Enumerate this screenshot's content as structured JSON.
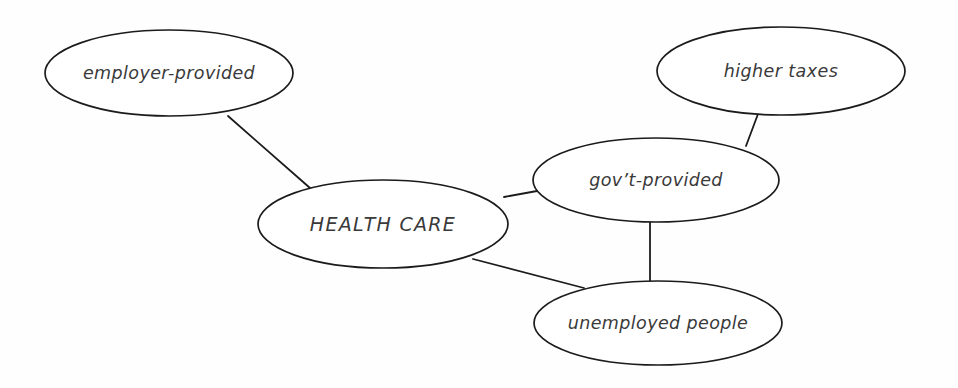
{
  "diagram": {
    "type": "concept-map",
    "title_node": "HEALTH CARE",
    "background_color": "#fefefe",
    "stroke_color": "#1b1b1b",
    "text_color": "#3a3a3a",
    "nodes": [
      {
        "id": "employer-provided",
        "label": "employer-provided",
        "cx": 169,
        "cy": 73,
        "rx": 124,
        "ry": 43,
        "style": "lowercase"
      },
      {
        "id": "higher-taxes",
        "label": "higher taxes",
        "cx": 781,
        "cy": 71,
        "rx": 124,
        "ry": 44,
        "style": "lowercase"
      },
      {
        "id": "govt-provided",
        "label": "gov’t-provided",
        "cx": 656,
        "cy": 180,
        "rx": 123,
        "ry": 42,
        "style": "lowercase"
      },
      {
        "id": "health-care",
        "label": "HEALTH CARE",
        "cx": 383,
        "cy": 224,
        "rx": 125,
        "ry": 44,
        "style": "uppercase"
      },
      {
        "id": "unemployed-people",
        "label": "unemployed people",
        "cx": 658,
        "cy": 323,
        "rx": 124,
        "ry": 42,
        "style": "lowercase"
      }
    ],
    "edges": [
      {
        "id": "edge-employer-to-health",
        "from": "employer-provided",
        "to": "health-care",
        "x1": 228,
        "y1": 116,
        "x2": 310,
        "y2": 188
      },
      {
        "id": "edge-health-to-govt",
        "from": "health-care",
        "to": "govt-provided",
        "x1": 504,
        "y1": 197,
        "x2": 537,
        "y2": 191
      },
      {
        "id": "edge-health-to-unemployed",
        "from": "health-care",
        "to": "unemployed-people",
        "x1": 473,
        "y1": 259,
        "x2": 584,
        "y2": 288
      },
      {
        "id": "edge-govt-to-unemployed",
        "from": "govt-provided",
        "to": "unemployed-people",
        "x1": 650,
        "y1": 222,
        "x2": 650,
        "y2": 284
      },
      {
        "id": "edge-taxes-to-govt",
        "from": "higher-taxes",
        "to": "govt-provided",
        "x1": 758,
        "y1": 114,
        "x2": 746,
        "y2": 146
      }
    ]
  }
}
